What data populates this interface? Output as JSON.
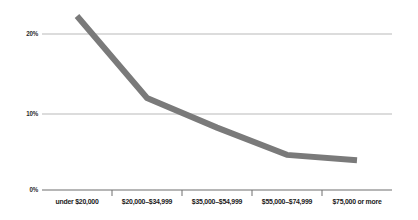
{
  "chart_data": {
    "type": "line",
    "title": "",
    "subtitle": "",
    "xlabel": "",
    "ylabel": "",
    "categories": [
      "under $20,000",
      "$20,000–$34,999",
      "$35,000–$54,999",
      "$55,000–$74,999",
      "$75,000 or more"
    ],
    "values": [
      22.3,
      11.8,
      8.0,
      4.5,
      3.8
    ],
    "series": [
      {
        "name": "",
        "values": [
          22.3,
          11.8,
          8.0,
          4.5,
          3.8
        ]
      }
    ],
    "ylim": [
      0,
      24
    ],
    "yticks": [
      0,
      10,
      20
    ],
    "ytick_labels": [
      "0%",
      "10%",
      "20%"
    ],
    "grid": true,
    "legend": "none",
    "line_color": "#7a7a7a",
    "grid_color": "#b9b9b9",
    "axis_color": "#6e6e6e",
    "text_color": "#1a1a1a",
    "background": "#ffffff"
  }
}
